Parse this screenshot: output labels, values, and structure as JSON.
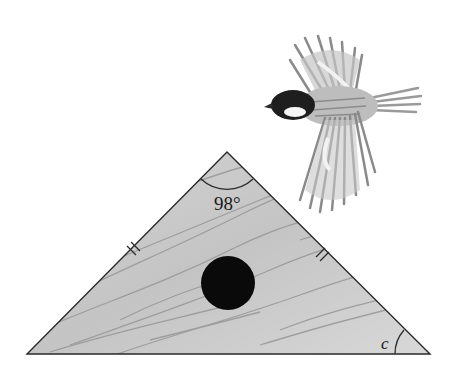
{
  "figure": {
    "type": "isosceles-triangle-birdhouse",
    "apex_angle_label": "98°",
    "base_angle_label": "c",
    "equal_sides_marked": true,
    "tick_marks_per_side": 2,
    "hole": "black circle entrance",
    "decoration": "bird in flight (chickadee)"
  },
  "colors": {
    "wood": "#c9c9c9",
    "wood_grain": "#8a8a8a",
    "outline": "#2a2a2a",
    "hole": "#0a0a0a",
    "bird_head": "#1e1e1e",
    "bird_body": "#bdbdbd"
  }
}
